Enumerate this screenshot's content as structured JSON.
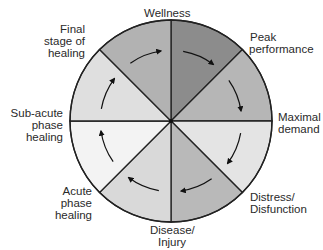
{
  "chart_data": {
    "type": "cycle-wheel",
    "title": "",
    "center": [
      171,
      121
    ],
    "radius": 101,
    "stages": [
      {
        "label": "Wellness",
        "lines": [
          "Wellness"
        ]
      },
      {
        "label": "Peak performance",
        "lines": [
          "Peak",
          "performance"
        ]
      },
      {
        "label": "Maximal demand",
        "lines": [
          "Maximal",
          "demand"
        ]
      },
      {
        "label": "Distress/ Disfunction",
        "lines": [
          "Distress/",
          "Disfunction"
        ]
      },
      {
        "label": "Disease/ Injury",
        "lines": [
          "Disease/",
          "Injury"
        ]
      },
      {
        "label": "Acute phase healing",
        "lines": [
          "Acute",
          "phase",
          "healing"
        ]
      },
      {
        "label": "Sub-acute phase healing",
        "lines": [
          "Sub-acute",
          "phase",
          "healing"
        ]
      },
      {
        "label": "Final stage of healing",
        "lines": [
          "Final",
          "stage of",
          "healing"
        ]
      }
    ],
    "sectors": [
      {
        "from": "Wellness",
        "to": "Peak performance",
        "fill": "#8c8c8c"
      },
      {
        "from": "Peak performance",
        "to": "Maximal demand",
        "fill": "#b6b6b6"
      },
      {
        "from": "Maximal demand",
        "to": "Distress/ Disfunction",
        "fill": "#e4e4e4"
      },
      {
        "from": "Distress/ Disfunction",
        "to": "Disease/ Injury",
        "fill": "#b9b9b9"
      },
      {
        "from": "Disease/ Injury",
        "to": "Acute phase healing",
        "fill": "#d9d9d9"
      },
      {
        "from": "Acute phase healing",
        "to": "Sub-acute phase healing",
        "fill": "#f3f3f3"
      },
      {
        "from": "Sub-acute phase healing",
        "to": "Final stage of healing",
        "fill": "#dfdfdf"
      },
      {
        "from": "Final stage of healing",
        "to": "Wellness",
        "fill": "#b2b2b2"
      }
    ],
    "direction": "clockwise",
    "line_color": "#222222"
  },
  "labels": {
    "wellness": "Wellness",
    "peak_1": "Peak",
    "peak_2": "performance",
    "maximal_1": "Maximal",
    "maximal_2": "demand",
    "distress_1": "Distress/",
    "distress_2": "Disfunction",
    "disease_1": "Disease/",
    "disease_2": "Injury",
    "acute_1": "Acute",
    "acute_2": "phase",
    "acute_3": "healing",
    "subacute_1": "Sub-acute",
    "subacute_2": "phase",
    "subacute_3": "healing",
    "final_1": "Final",
    "final_2": "stage of",
    "final_3": "healing"
  }
}
